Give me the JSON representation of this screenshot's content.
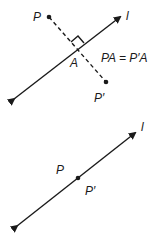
{
  "figure_top": {
    "line_label": "l",
    "point_label": "P",
    "foot_label": "A",
    "image_label": "P′",
    "equation": "PA = P′A",
    "right_angle_marker": true
  },
  "figure_bottom": {
    "line_label": "l",
    "point_label": "P",
    "image_label": "P′"
  }
}
